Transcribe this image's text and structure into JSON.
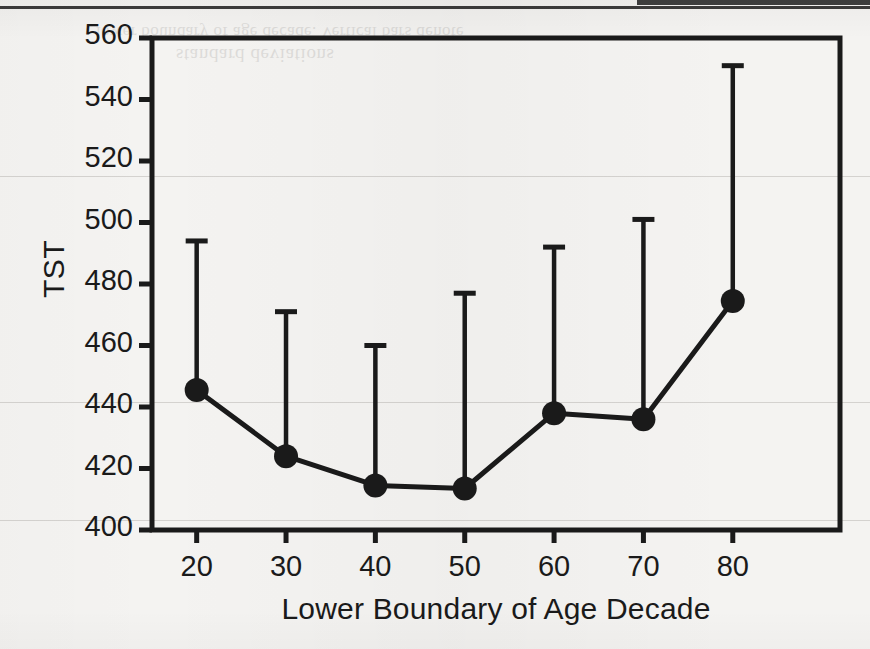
{
  "figure": {
    "ylabel": "TST",
    "xlabel": "Lower Boundary of Age Decade"
  },
  "artifacts": {
    "ghost_text_1": "lower boundary of age decade. Vertical bars denote",
    "ghost_text_2": "standard deviations"
  },
  "chart_data": {
    "type": "line",
    "title": "",
    "xlabel": "Lower Boundary of Age Decade",
    "ylabel": "TST",
    "x": [
      20,
      30,
      40,
      50,
      60,
      70,
      80
    ],
    "categories": [
      "20",
      "30",
      "40",
      "50",
      "60",
      "70",
      "80"
    ],
    "values": [
      445.5,
      424.0,
      414.5,
      413.5,
      438.0,
      436.0,
      474.5
    ],
    "error_upper": [
      494.0,
      471.0,
      460.0,
      477.0,
      492.0,
      501.0,
      551.0
    ],
    "error_bar_style": "upper-only-with-cap",
    "marker": "filled-circle",
    "series": [
      {
        "name": "TST",
        "values": [
          445.5,
          424.0,
          414.5,
          413.5,
          438.0,
          436.0,
          474.5
        ]
      }
    ],
    "xlim": [
      15,
      92
    ],
    "ylim": [
      400,
      560
    ],
    "ytick_labels": [
      "400",
      "420",
      "440",
      "460",
      "480",
      "500",
      "520",
      "540",
      "560"
    ],
    "yticks": [
      400,
      420,
      440,
      460,
      480,
      500,
      520,
      540,
      560
    ],
    "xtick_labels": [
      "20",
      "30",
      "40",
      "50",
      "60",
      "70",
      "80"
    ],
    "xticks": [
      20,
      30,
      40,
      50,
      60,
      70,
      80
    ],
    "grid": false,
    "legend": "none",
    "line_color": "#1a1a1a",
    "marker_color": "#1a1a1a",
    "frame_color": "#1a1a1a",
    "background_color": "#f4f3f1"
  }
}
